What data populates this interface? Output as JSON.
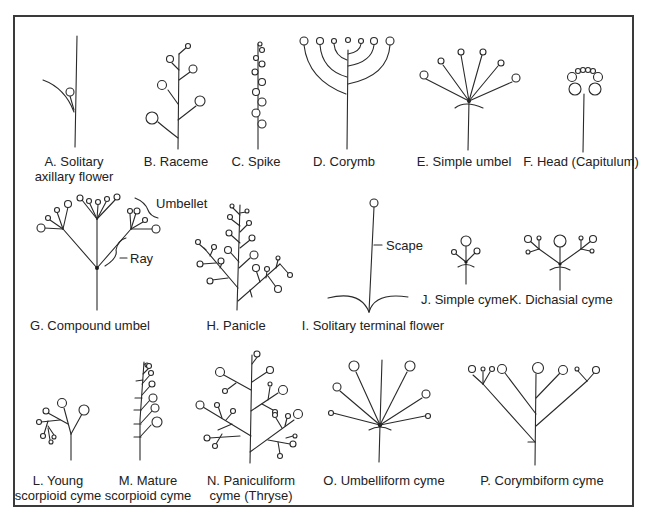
{
  "figure": {
    "panels": [
      {
        "id": "A",
        "label_line1": "A. Solitary",
        "label_line2": "axillary flower"
      },
      {
        "id": "B",
        "label_line1": "B. Raceme"
      },
      {
        "id": "C",
        "label_line1": "C. Spike"
      },
      {
        "id": "D",
        "label_line1": "D. Corymb"
      },
      {
        "id": "E",
        "label_line1": "E. Simple umbel"
      },
      {
        "id": "F",
        "label_line1": "F. Head (Capitulum)"
      },
      {
        "id": "G",
        "label_line1": "G. Compound umbel"
      },
      {
        "id": "H",
        "label_line1": "H. Panicle"
      },
      {
        "id": "I",
        "label_line1": "I. Solitary terminal flower"
      },
      {
        "id": "J",
        "label_line1": "J. Simple cyme"
      },
      {
        "id": "K",
        "label_line1": "K. Dichasial cyme"
      },
      {
        "id": "L",
        "label_line1": "L. Young",
        "label_line2": "scorpioid cyme"
      },
      {
        "id": "M",
        "label_line1": "M. Mature",
        "label_line2": "scorpioid cyme"
      },
      {
        "id": "N",
        "label_line1": "N. Paniculiform",
        "label_line2": "cyme (Thryse)"
      },
      {
        "id": "O",
        "label_line1": "O. Umbelliform cyme"
      },
      {
        "id": "P",
        "label_line1": "P. Corymbiform cyme"
      }
    ],
    "annotations": {
      "umbellet": "Umbellet",
      "ray": "Ray",
      "scape": "Scape"
    },
    "colors": {
      "line": "#2a2a2a",
      "frame": "#3a3a3a",
      "background": "#ffffff"
    }
  }
}
